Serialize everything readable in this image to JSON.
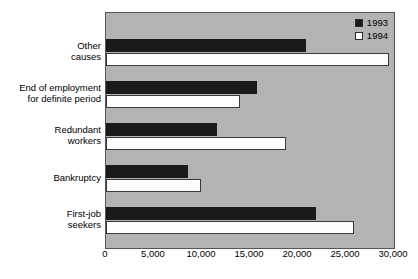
{
  "chart_data": {
    "type": "bar",
    "orientation": "horizontal",
    "title": "",
    "xlabel": "",
    "ylabel": "",
    "categories": [
      "Other\ncauses",
      "End of employment\nfor definite period",
      "Redundant\nworkers",
      "Bankruptcy",
      "First-job\nseekers"
    ],
    "series": [
      {
        "name": "1993",
        "color": "#1a1a1a",
        "values": [
          20800,
          15700,
          11600,
          8500,
          21900
        ]
      },
      {
        "name": "1994",
        "color": "#ffffff",
        "values": [
          29500,
          14000,
          18800,
          9900,
          25800
        ]
      }
    ],
    "xlim": [
      0,
      30000
    ],
    "xticks": [
      0,
      5000,
      10000,
      15000,
      20000,
      25000,
      30000
    ],
    "xtick_labels": [
      "0",
      "5,000",
      "10,000",
      "15,000",
      "20,000",
      "25,000",
      "30,000"
    ],
    "grid": false,
    "legend_position": "top-right",
    "plot_background": "#b3b3b3"
  },
  "legend": {
    "items": [
      {
        "label": "1993",
        "swatch": "filled-black-swatch"
      },
      {
        "label": "1994",
        "swatch": "empty-white-swatch"
      }
    ]
  }
}
